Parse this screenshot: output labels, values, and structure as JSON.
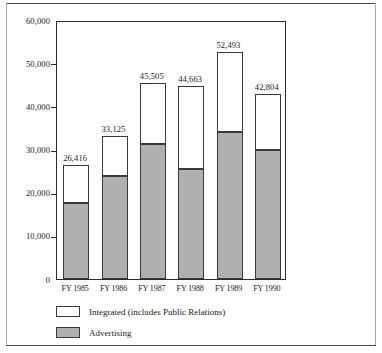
{
  "chart_data": {
    "type": "bar",
    "subtype": "stacked-vertical-bar",
    "title": "",
    "xlabel": "",
    "ylabel": "",
    "ylim": [
      0,
      60000
    ],
    "grid": false,
    "legend_position": "bottom-left",
    "categories": [
      "FY 1985",
      "FY 1986",
      "FY 1987",
      "FY 1988",
      "FY 1989",
      "FY 1990"
    ],
    "ytick_labels": [
      "60,000",
      "50,000",
      "40,000",
      "30,000",
      "20,000",
      "10,000",
      "0"
    ],
    "ytick_values": [
      60000,
      50000,
      40000,
      30000,
      20000,
      10000,
      0
    ],
    "series": [
      {
        "name": "Advertising",
        "color": "#b0b0b0",
        "values": [
          17600,
          23800,
          31200,
          25500,
          34000,
          29900
        ]
      },
      {
        "name": "Integrated (includes Public Relations)",
        "color": "#ffffff",
        "values": [
          8816,
          9325,
          14305,
          19163,
          18493,
          12904
        ]
      }
    ],
    "totals": [
      26416,
      33125,
      45505,
      44663,
      52493,
      42804
    ],
    "total_labels": [
      "26,416",
      "33,125",
      "45,505",
      "44,663",
      "52,493",
      "42,804"
    ]
  },
  "legend": {
    "items": [
      {
        "label": "Integrated (includes Public Relations)",
        "swatch": "white-swatch"
      },
      {
        "label": "Advertising",
        "swatch": "gray-swatch"
      }
    ]
  },
  "colors": {
    "advertising": "#b0b0b0",
    "integrated": "#ffffff",
    "outline": "#3a3a3a",
    "axis": "#2b2b2b",
    "text": "#1a1a1a"
  }
}
